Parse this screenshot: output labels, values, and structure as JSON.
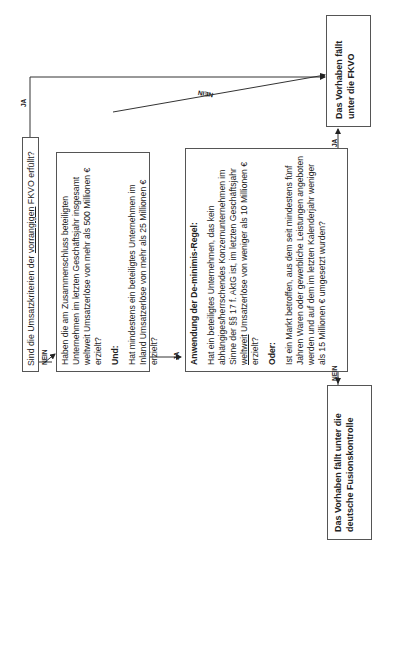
{
  "diagram": {
    "orientation": "rotated-90-ccw",
    "q1": {
      "prefix": "Sind die Umsatzkriterien der ",
      "underlined": "vorrangigen",
      "suffix": " FKVO erfüllt?"
    },
    "box2": {
      "para1": "Haben die am Zusammenschluss beteiligten Unternehmen im letzten Geschäftsjahr insgesamt weltweit Umsatzerlöse von mehr als 500 Millionen € erzielt?",
      "connector": "Und:",
      "para2": "Hat mindestens ein beteiligtes Unternehmen im Inland Umsatzerlöse von mehr als 25 Millionen € erzielt?"
    },
    "box3": {
      "heading": "Anwendung der De-minimis-Regel:",
      "para1_a": "Hat ein beteiligtes Unternehmen, das kein abhängiges/herrschendes Konzernunternehmen im Sinne der §§ 17 f. AktG ist, im letzten Geschäftsjahr ",
      "para1_underlined": "weltweit",
      "para1_b": " Umsatzerlöse von weniger als 10 Millionen € erzielt?",
      "connector": "Oder:",
      "para2": "Ist ein Markt betroffen, aus dem seit mindestens fünf Jahren Waren oder gewerbliche Leistungen angeboten werden und auf dem im letzten Kalenderjahr weniger als 15 Millionen € umgesetzt wurden?"
    },
    "result_fkvo": "Das Vorhaben fällt unter die FKVO",
    "result_german": "Das Vorhaben fällt unter die deutsche Fusionskontrolle",
    "edge_labels": {
      "q1_to_fkvo": "JA",
      "q1_to_box2": "NEIN",
      "box2_to_fkvo": "NEIN",
      "box2_to_box3": "JA",
      "box3_to_fkvo": "JA",
      "box3_to_german": "NEIN"
    }
  }
}
